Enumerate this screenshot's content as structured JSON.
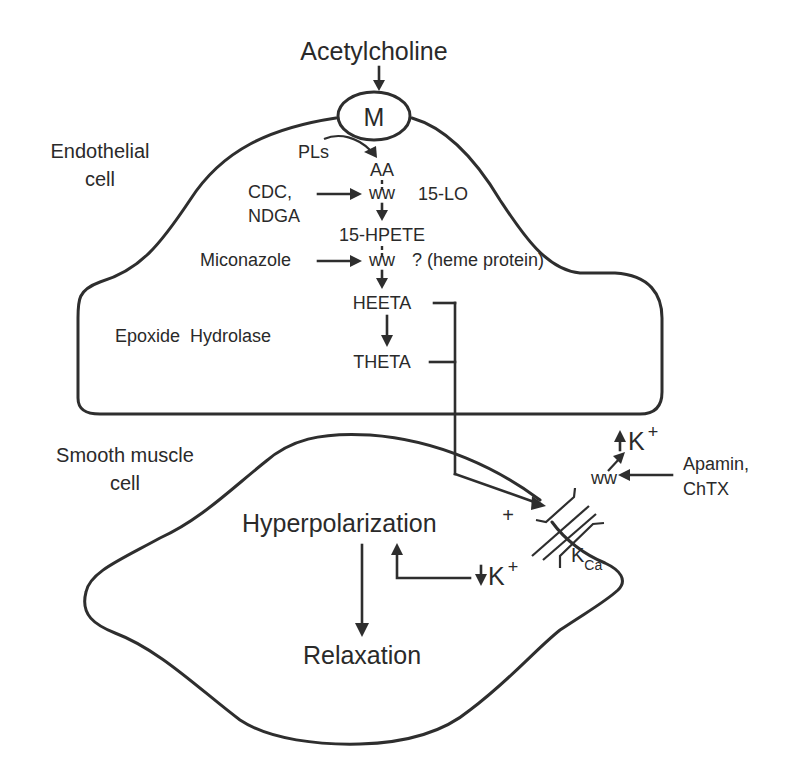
{
  "figure": {
    "ligand": "Acetylcholine",
    "receptor": "M",
    "endothelial_cell": {
      "label_line1": "Endothelial",
      "label_line2": "cell",
      "pathway": {
        "precursor": "PLs",
        "substrate": "AA",
        "inhibitor_1_line1": "CDC,",
        "inhibitor_1_line2": "NDGA",
        "enzyme_1": "15-LO",
        "intermediate": "15-HPETE",
        "inhibitor_2": "Miconazole",
        "enzyme_2": "? (heme protein)",
        "product_1": "HEETA",
        "enzyme_3": "Epoxide  Hydrolase",
        "product_2": "THETA"
      }
    },
    "smooth_muscle_cell": {
      "label_line1": "Smooth muscle",
      "label_line2": "cell",
      "channel": "K",
      "channel_subscript": "Ca",
      "activation_sign": "+",
      "blocker_line1": "Apamin,",
      "blocker_line2": "ChTX",
      "k_efflux": "K",
      "k_efflux_charge": "+",
      "k_intracellular": "K",
      "k_intracellular_charge": "+",
      "effect_1": "Hyperpolarization",
      "effect_2": "Relaxation"
    }
  },
  "colors": {
    "ink": "#2e2e2e",
    "background": "#ffffff"
  }
}
